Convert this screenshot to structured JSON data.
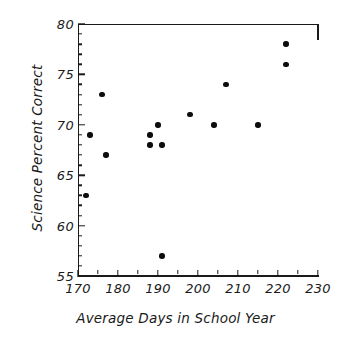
{
  "chart_data": {
    "type": "scatter",
    "title": "",
    "xlabel": "Average Days in School Year",
    "ylabel": "Science Percent Correct",
    "xlim": [
      170,
      230
    ],
    "ylim": [
      55,
      80
    ],
    "x_major_ticks": [
      170,
      180,
      190,
      200,
      210,
      220,
      230
    ],
    "x_minor_step": 5,
    "y_major_ticks": [
      55,
      60,
      65,
      70,
      75,
      80
    ],
    "y_minor_step": 1,
    "grid": false,
    "legend": null,
    "marker": "filled-circle",
    "marker_color": "#0d0d0d",
    "points": [
      {
        "x": 172,
        "y": 63
      },
      {
        "x": 173,
        "y": 69
      },
      {
        "x": 176,
        "y": 73
      },
      {
        "x": 177,
        "y": 67
      },
      {
        "x": 188,
        "y": 68
      },
      {
        "x": 188,
        "y": 69
      },
      {
        "x": 190,
        "y": 70
      },
      {
        "x": 191,
        "y": 68
      },
      {
        "x": 191,
        "y": 57
      },
      {
        "x": 198,
        "y": 71
      },
      {
        "x": 204,
        "y": 70
      },
      {
        "x": 207,
        "y": 74
      },
      {
        "x": 215,
        "y": 70
      },
      {
        "x": 222,
        "y": 76
      },
      {
        "x": 222,
        "y": 78
      }
    ],
    "x_tick_labels": [
      "170",
      "180",
      "190",
      "200",
      "210",
      "220",
      "230"
    ],
    "y_tick_labels": [
      "55",
      "60",
      "65",
      "70",
      "75",
      "80"
    ]
  }
}
